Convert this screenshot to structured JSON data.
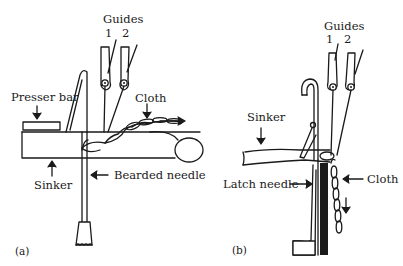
{
  "panel_a": {
    "caption": "(a)",
    "guides_label": "Guides",
    "guide_numbers": [
      "1",
      "2"
    ],
    "presser_bar_label": "Presser bar",
    "cloth_label": "Cloth",
    "sinker_label": "Sinker",
    "needle_label": "Bearded needle"
  },
  "panel_b": {
    "caption": "(b)",
    "guides_label": "Guides",
    "guide_numbers": [
      "1",
      "2"
    ],
    "sinker_label": "Sinker",
    "needle_label": "Latch needle",
    "cloth_label": "Cloth"
  }
}
